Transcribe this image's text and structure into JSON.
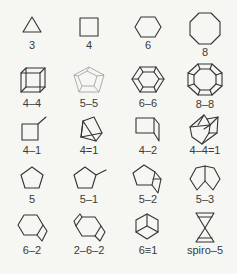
{
  "figure": {
    "rows": [
      [
        {
          "label": "3",
          "shape": "triangle"
        },
        {
          "label": "4",
          "shape": "square"
        },
        {
          "label": "6",
          "shape": "hexagon"
        },
        {
          "label": "8",
          "shape": "octagon"
        }
      ],
      [
        {
          "label": "4–4",
          "shape": "cube"
        },
        {
          "label": "5–5",
          "shape": "pentagonal-prism"
        },
        {
          "label": "6–6",
          "shape": "hexagonal-prism"
        },
        {
          "label": "8–8",
          "shape": "octagonal-prism"
        }
      ],
      [
        {
          "label": "4–1",
          "shape": "square-with-tail"
        },
        {
          "label": "4=1",
          "shape": "bicyclobutane-fused-square"
        },
        {
          "label": "4–2",
          "shape": "square-with-fused-wedge"
        },
        {
          "label": "4–4=1",
          "shape": "cage-polycycle"
        }
      ],
      [
        {
          "label": "5",
          "shape": "pentagon"
        },
        {
          "label": "5–1",
          "shape": "pentagon-with-tail"
        },
        {
          "label": "5–2",
          "shape": "pentagon-fused-square"
        },
        {
          "label": "5–3",
          "shape": "fused-pentagons"
        }
      ],
      [
        {
          "label": "6–2",
          "shape": "hexagon-fused-rhombus"
        },
        {
          "label": "2–6–2",
          "shape": "hexagon-two-fused-rhombi"
        },
        {
          "label": "6≡1",
          "shape": "bicyclic-hexagon-cube-view"
        },
        {
          "label": "spiro–5",
          "shape": "spiro-bowtie"
        }
      ]
    ],
    "colors": {
      "background": "#f6f6f3",
      "stroke": "#333333",
      "light_stroke": "#9a9a9a",
      "label": "#3a3a3a"
    }
  }
}
